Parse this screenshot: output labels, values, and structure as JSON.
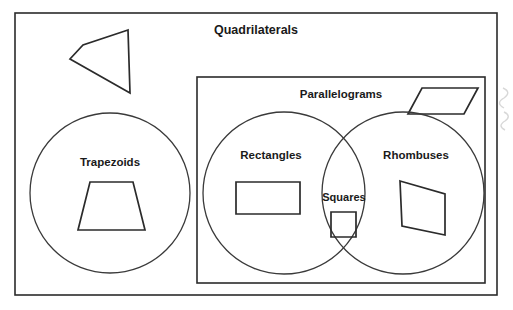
{
  "diagram": {
    "type": "euler-diagram",
    "title": "Quadrilaterals",
    "background_color": "#ffffff",
    "stroke_color": "#2b2b2b",
    "label_color": "#1a1a1a",
    "sets": [
      {
        "id": "quadrilaterals",
        "label": "Quadrilaterals",
        "shape": "rectangle",
        "bounds": {
          "x": 15,
          "y": 13,
          "width": 482,
          "height": 282
        },
        "label_position": {
          "x": 256,
          "y": 31
        },
        "label_size": "label-xl"
      },
      {
        "id": "parallelograms",
        "label": "Parallelograms",
        "shape": "rectangle",
        "bounds": {
          "x": 197,
          "y": 77,
          "width": 288,
          "height": 206
        },
        "label_position": {
          "x": 341,
          "y": 95
        },
        "label_size": "label-lg"
      },
      {
        "id": "trapezoids",
        "label": "Trapezoids",
        "shape": "circle",
        "center": {
          "x": 110,
          "y": 193
        },
        "radius": 80,
        "label_position": {
          "x": 110,
          "y": 163
        },
        "label_size": "label-lg"
      },
      {
        "id": "rectangles",
        "label": "Rectangles",
        "shape": "circle",
        "center": {
          "x": 284,
          "y": 193
        },
        "radius": 81,
        "label_position": {
          "x": 271,
          "y": 156
        },
        "label_size": "label-lg"
      },
      {
        "id": "rhombuses",
        "label": "Rhombuses",
        "shape": "circle",
        "center": {
          "x": 403,
          "y": 193
        },
        "radius": 81,
        "label_position": {
          "x": 416,
          "y": 156
        },
        "label_size": "label-lg"
      },
      {
        "id": "squares",
        "label": "Squares",
        "shape": "lens-intersection",
        "intersection_of": [
          "rectangles",
          "rhombuses"
        ],
        "label_position": {
          "x": 344,
          "y": 198
        },
        "label_size": "label-md"
      }
    ],
    "example_shapes": [
      {
        "id": "generic-quadrilateral",
        "name": "generic-quadrilateral-example",
        "belongs_to": "quadrilaterals",
        "points": "128,30 83,45 70,59 130,93"
      },
      {
        "id": "trapezoid",
        "name": "trapezoid-example",
        "belongs_to": "trapezoids",
        "points": "90,182 133,182 145,230 78,230"
      },
      {
        "id": "rectangle",
        "name": "rectangle-example",
        "belongs_to": "rectangles",
        "points": "236,182 300,182 300,214 236,214"
      },
      {
        "id": "square",
        "name": "square-example",
        "belongs_to": "squares",
        "points": "331,212 356,212 356,237 331,237"
      },
      {
        "id": "rhombus",
        "name": "rhombus-example",
        "belongs_to": "rhombuses",
        "points": "400,181 445,194 445,235 402,226"
      },
      {
        "id": "parallelogram",
        "name": "parallelogram-example",
        "belongs_to": "parallelograms",
        "points": "422,88 478,88 464,114 408,114"
      }
    ]
  }
}
